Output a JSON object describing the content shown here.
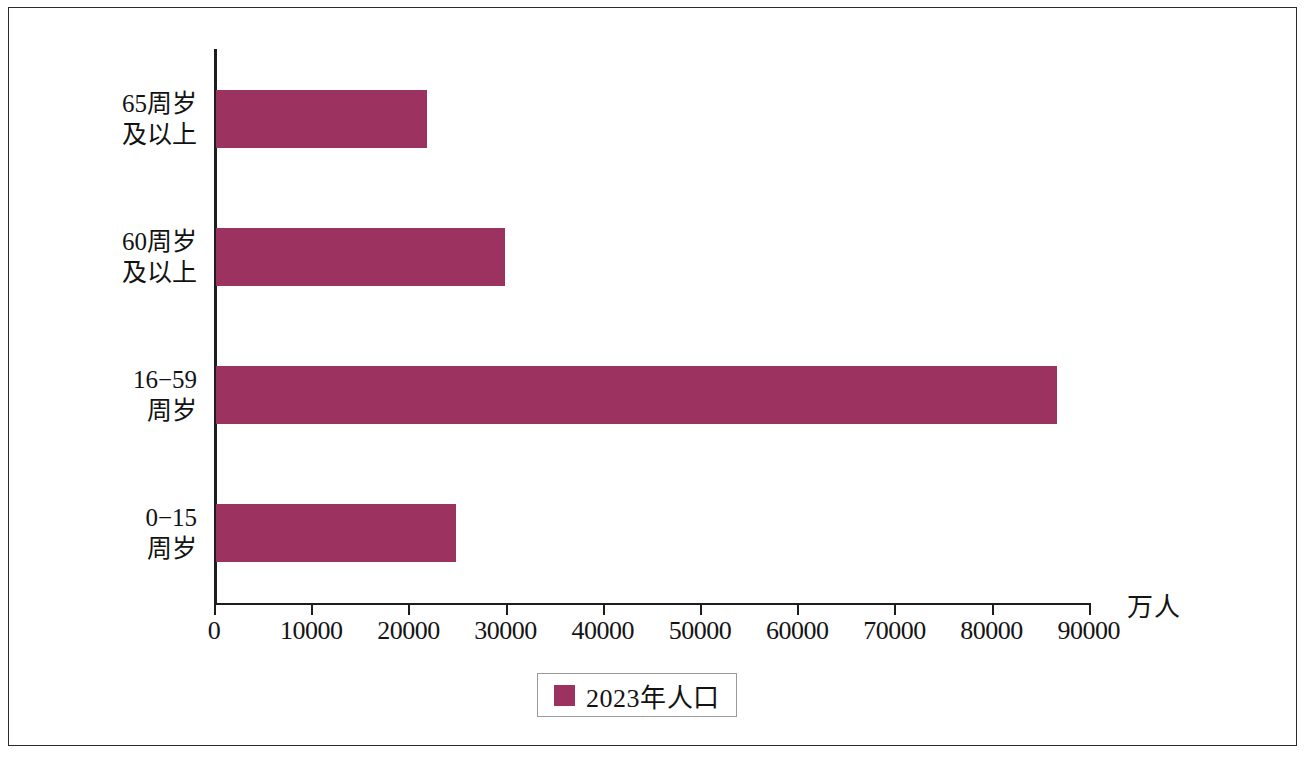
{
  "chart_data": {
    "type": "bar",
    "orientation": "horizontal",
    "title": "",
    "xlabel": "万人",
    "ylabel": "",
    "xlim": [
      0,
      90000
    ],
    "grid": false,
    "legend_position": "bottom",
    "categories": [
      "0−15\n周岁",
      "16−59\n周岁",
      "60周岁\n及以上",
      "65周岁\n及以上"
    ],
    "series": [
      {
        "name": "2023年人口",
        "color": "#9c3260",
        "values": [
          24678,
          86481,
          29697,
          21676
        ]
      }
    ],
    "x_ticks": [
      0,
      10000,
      20000,
      30000,
      40000,
      50000,
      60000,
      70000,
      80000,
      90000
    ],
    "x_tick_labels": [
      "0",
      "10000",
      "20000",
      "30000",
      "40000",
      "50000",
      "60000",
      "70000",
      "80000",
      "90000"
    ]
  },
  "legend": {
    "label": "2023年人口",
    "swatch_color": "#9c3260"
  },
  "axis": {
    "unit_label": "万人"
  }
}
